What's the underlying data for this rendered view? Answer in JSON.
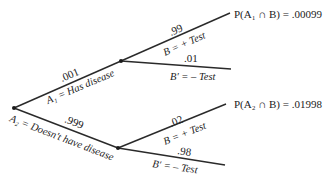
{
  "diagram": {
    "type": "probability-tree",
    "first_stage": [
      {
        "prob": ".001",
        "event": "A₁ = Has disease"
      },
      {
        "prob": ".999",
        "event": "A₂ = Doesn't have disease"
      }
    ],
    "second_stage_A1": [
      {
        "prob": ".99",
        "event": "B = + Test"
      },
      {
        "prob": ".01",
        "event": "B′ = – Test"
      }
    ],
    "second_stage_A2": [
      {
        "prob": ".02",
        "event": "B = + Test"
      },
      {
        "prob": ".98",
        "event": "B′ = – Test"
      }
    ],
    "results": [
      {
        "label": "P(A₁ ∩ B) = .00099"
      },
      {
        "label": "P(A₂ ∩ B) = .01998"
      }
    ]
  }
}
